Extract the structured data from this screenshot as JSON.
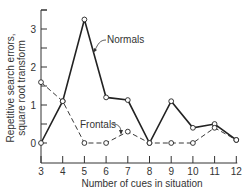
{
  "chart_data": {
    "type": "line",
    "title": "",
    "xlabel": "Number of cues in situation",
    "ylabel": [
      "Repetitive search errors,",
      "square root transform"
    ],
    "x": [
      3,
      4,
      5,
      6,
      7,
      8,
      9,
      10,
      11,
      12
    ],
    "xlim": [
      3,
      12
    ],
    "ylim": [
      -0.55,
      3.5
    ],
    "yticks": [
      0,
      1,
      2,
      3
    ],
    "yminor_ticks": [
      0.5,
      1.5,
      2.5,
      3.5
    ],
    "grid": false,
    "legend": "inline labels with leader arrows",
    "series": [
      {
        "name": "Normals",
        "style": "solid",
        "marker": "open-circle",
        "values": [
          0,
          1.1,
          3.25,
          1.2,
          1.13,
          0,
          1.1,
          0.4,
          0.5,
          0.08
        ]
      },
      {
        "name": "Frontals",
        "style": "dashed",
        "marker": "open-circle",
        "values": [
          1.6,
          1.1,
          0,
          0,
          0.3,
          0,
          0,
          0,
          0.4,
          0.08
        ]
      }
    ]
  },
  "labels": {
    "xlabel": "Number of cues in situation",
    "ylabel_line1": "Repetitive search errors,",
    "ylabel_line2": "square root transform",
    "normals": "Normals",
    "frontals": "Frontals",
    "xticks": [
      "3",
      "4",
      "5",
      "6",
      "7",
      "8",
      "9",
      "10",
      "11",
      "12"
    ],
    "yticks": [
      "0",
      "1",
      "2",
      "3"
    ]
  }
}
